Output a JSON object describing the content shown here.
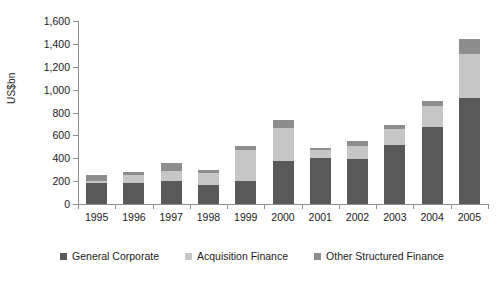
{
  "chart_data": {
    "type": "bar",
    "title": "",
    "subtitle": "",
    "xlabel": "",
    "ylabel": "US$bn",
    "ylim": [
      0,
      1600
    ],
    "ytick_step": 200,
    "grid": false,
    "stacked": true,
    "legend_position": "bottom",
    "categories": [
      "1995",
      "1996",
      "1997",
      "1998",
      "1999",
      "2000",
      "2001",
      "2002",
      "2003",
      "2004",
      "2005"
    ],
    "ytick_labels": [
      "0",
      "200",
      "400",
      "600",
      "800",
      "1,000",
      "1,200",
      "1,400",
      "1,600"
    ],
    "ytick_values": [
      0,
      200,
      400,
      600,
      800,
      1000,
      1200,
      1400,
      1600
    ],
    "series": [
      {
        "name": "General Corporate",
        "color": "#595959",
        "values": [
          185,
          180,
          205,
          165,
          200,
          380,
          400,
          395,
          515,
          670,
          925
        ]
      },
      {
        "name": "Acquisition Finance",
        "color": "#c6c6c6",
        "values": [
          20,
          75,
          85,
          105,
          275,
          285,
          70,
          115,
          145,
          190,
          390
        ]
      },
      {
        "name": "Other Structured Finance",
        "color": "#8d8d8d",
        "values": [
          45,
          25,
          70,
          30,
          35,
          70,
          20,
          45,
          30,
          45,
          125
        ]
      }
    ],
    "totals": [
      250,
      280,
      360,
      300,
      510,
      735,
      490,
      555,
      690,
      905,
      1440
    ]
  },
  "legend": {
    "items": [
      {
        "label": "General Corporate",
        "color": "#595959"
      },
      {
        "label": "Acquisition Finance",
        "color": "#c6c6c6"
      },
      {
        "label": "Other Structured Finance",
        "color": "#8d8d8d"
      }
    ]
  },
  "axis": {
    "y_title": "US$bn"
  }
}
